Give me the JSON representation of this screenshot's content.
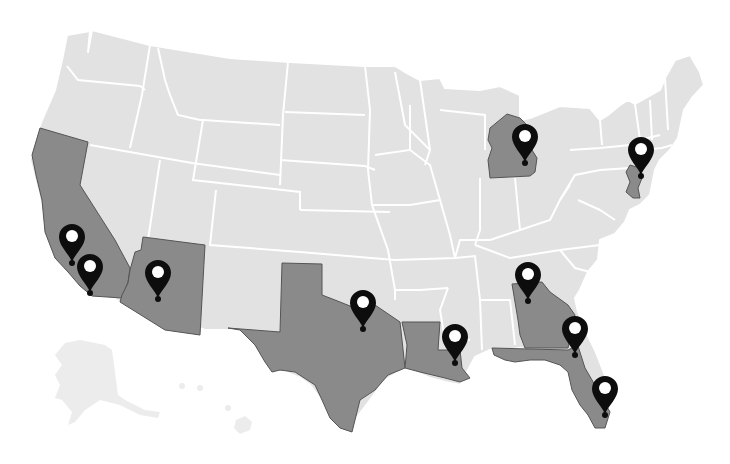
{
  "map": {
    "title": "",
    "colors": {
      "background": "#ffffff",
      "base_state": "#e2e2e2",
      "highlight_state": "#8a8a8a",
      "border": "#ffffff",
      "pin": "#0d0d0d"
    },
    "highlighted_states": [
      "California",
      "Arizona",
      "Texas",
      "Louisiana",
      "Michigan",
      "New Jersey",
      "Georgia",
      "Florida"
    ],
    "pins": [
      {
        "id": "pin-california-1",
        "state": "California",
        "x": 72,
        "y": 262,
        "icon": "map-pin-icon"
      },
      {
        "id": "pin-california-2",
        "state": "California",
        "x": 90,
        "y": 292,
        "icon": "map-pin-icon"
      },
      {
        "id": "pin-arizona",
        "state": "Arizona",
        "x": 158,
        "y": 298,
        "icon": "map-pin-icon"
      },
      {
        "id": "pin-texas",
        "state": "Texas",
        "x": 363,
        "y": 328,
        "icon": "map-pin-icon"
      },
      {
        "id": "pin-louisiana",
        "state": "Louisiana",
        "x": 455,
        "y": 362,
        "icon": "map-pin-icon"
      },
      {
        "id": "pin-michigan",
        "state": "Michigan",
        "x": 525,
        "y": 162,
        "icon": "map-pin-icon"
      },
      {
        "id": "pin-new-jersey",
        "state": "New Jersey",
        "x": 641,
        "y": 175,
        "icon": "map-pin-icon"
      },
      {
        "id": "pin-georgia",
        "state": "Georgia",
        "x": 528,
        "y": 300,
        "icon": "map-pin-icon"
      },
      {
        "id": "pin-florida-1",
        "state": "Florida",
        "x": 575,
        "y": 354,
        "icon": "map-pin-icon"
      },
      {
        "id": "pin-florida-2",
        "state": "Florida",
        "x": 605,
        "y": 414,
        "icon": "map-pin-icon"
      }
    ]
  }
}
